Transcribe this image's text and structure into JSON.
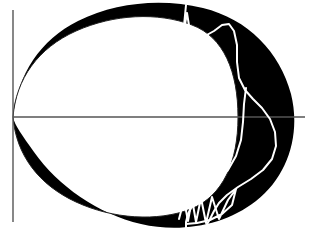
{
  "figure": {
    "title": "",
    "background_color": "#ffffff",
    "width": 312,
    "height": 232
  },
  "chart_data": {
    "type": "line",
    "title": "",
    "subtitle": "",
    "xlabel": "",
    "ylabel": "",
    "grid": false,
    "legend": null,
    "legend_position": "none",
    "xlim": [
      -0.06,
      1.46
    ],
    "ylim": [
      -0.78,
      0.78
    ],
    "axes": {
      "x_axis": {
        "label": "",
        "color": "#555555",
        "origin_px": {
          "x": 13,
          "y": 117
        },
        "end_px": {
          "x": 305,
          "y": 117
        },
        "tick_labels": [],
        "visible": true
      },
      "y_axis": {
        "label": "",
        "color": "#555555",
        "start_px": {
          "x": 13,
          "y": 10
        },
        "end_px": {
          "x": 13,
          "y": 222
        },
        "tick_labels": [],
        "visible": true
      }
    },
    "series": [
      {
        "name": "outer-boundary",
        "role": "filled-region-outer",
        "style": "filled",
        "fill_color": "#000000",
        "stroke_color": "#000000",
        "stroke_width": 1,
        "description": "Outer egg-shaped closed curve, cusp at origin, widest right lobe near x=1.40",
        "path_px": "M 13 117 C 18 74 40 40 78 21 C 116 2 162 -2 203 8 C 248 19 280 52 291 94 C 301 134 288 176 256 201 C 224 226 180 233 141 224 C 98 214 58 186 34 152 C 22 135 15 126 13 117 Z"
      },
      {
        "name": "inner-oval",
        "role": "filled-region-inner-hole",
        "style": "thin-outline",
        "fill_color": "#ffffff",
        "stroke_color": "#222222",
        "stroke_width": 1,
        "description": "Thin inner oval outline sharing the cusp at the origin; creates the white hole inside the black band",
        "path_px": "M 13 117 C 16 79 38 48 76 31 C 114 14 158 12 192 25 C 224 37 238 72 238 117 C 238 162 223 196 191 209 C 157 222 113 219 76 202 C 39 185 16 155 13 117 Z"
      },
      {
        "name": "white-trajectory",
        "role": "overlay-curve",
        "style": "solid",
        "stroke_color": "#ffffff",
        "stroke_width": 2,
        "description": "White oscillating trajectory: enters at top with a narrow spike, sweeps down the right lobe in a broad S, then resolves into a tight zigzag bundle at the bottom",
        "path_px": "M 186 5 L 183 36 L 187 13 L 191 38 L 197 30 L 205 36 L 214 31 L 222 25 L 229 24 L 234 31 L 237 45 L 237 62 L 239 78 L 245 90 L 253 99 L 262 108 L 270 119 L 275 132 L 276 146 L 272 159 L 263 170 L 251 179 L 238 187 L 227 195 L 219 203 L 214 211 L 210 219 L 206 226"
      },
      {
        "name": "white-trajectory-branch",
        "role": "overlay-curve",
        "style": "solid",
        "stroke_color": "#ffffff",
        "stroke_width": 2,
        "description": "Second strand of the white trajectory descending inside the black lobe toward the bottom zigzag",
        "path_px": "M 246 88 L 244 104 L 243 122 L 241 140 L 236 156 L 228 170 L 218 181 L 208 190 L 199 198 L 192 206 L 188 214 L 186 222 L 186 229"
      },
      {
        "name": "white-zigzag-bundle",
        "role": "overlay-curve",
        "style": "solid",
        "stroke_color": "#ffffff",
        "stroke_width": 2,
        "description": "Tight zigzag / folded loop bundle where the trajectory accumulates near the bottom of the crescent",
        "path_px": "M 179 219 L 184 200 L 188 221 L 192 199 L 196 222 L 201 198 L 206 223 L 212 197 L 219 219 L 228 200 L 236 189 L 232 205 L 222 214 L 210 220 L 197 223 L 186 224"
      }
    ],
    "annotations": []
  },
  "palette": {
    "region_fill": "#000000",
    "background": "#ffffff",
    "axis": "#555555",
    "inner_outline": "#222222",
    "trajectory": "#ffffff"
  }
}
